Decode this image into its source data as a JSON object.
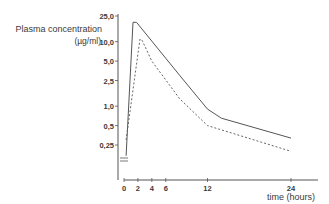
{
  "chart_data": {
    "type": "line",
    "title": "",
    "ylabel": "Plasma concentration",
    "ylabel_unit": "(µg/ml)",
    "xlabel": "time (hours)",
    "yscale": "log",
    "ylim": [
      0.15,
      28
    ],
    "xlim": [
      0,
      28
    ],
    "y_ticks": [
      {
        "label": "25,0",
        "value": 25.0
      },
      {
        "label": "10,0",
        "value": 10.0
      },
      {
        "label": "5,0",
        "value": 5.0
      },
      {
        "label": "2,5",
        "value": 2.5
      },
      {
        "label": "1,0",
        "value": 1.0
      },
      {
        "label": "0,5",
        "value": 0.5
      },
      {
        "label": "0,25",
        "value": 0.25
      }
    ],
    "x_ticks": [
      {
        "label": "0",
        "value": 0
      },
      {
        "label": "2",
        "value": 2
      },
      {
        "label": "4",
        "value": 4
      },
      {
        "label": "6",
        "value": 6
      },
      {
        "label": "12",
        "value": 12
      },
      {
        "label": "24",
        "value": 24
      }
    ],
    "grid": false,
    "legend": null,
    "axis_break_marker": true,
    "series": [
      {
        "name": "solid",
        "style": "solid",
        "x": [
          0.3,
          1.3,
          1.8,
          8,
          12,
          14,
          24
        ],
        "values": [
          0.17,
          20,
          20,
          3.0,
          0.9,
          0.65,
          0.32
        ]
      },
      {
        "name": "dashed",
        "style": "dashed",
        "x": [
          0.3,
          2.3,
          2.6,
          4,
          8,
          12,
          24
        ],
        "values": [
          0.3,
          11,
          10.5,
          5.0,
          1.3,
          0.5,
          0.2
        ]
      }
    ]
  }
}
